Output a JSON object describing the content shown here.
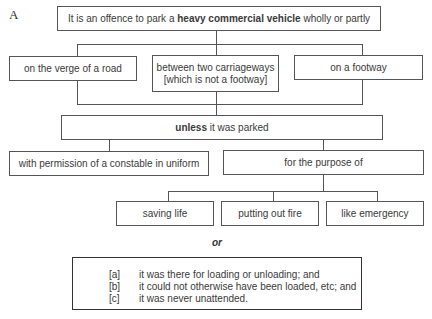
{
  "figure_label": "A",
  "top": {
    "prefix": "It is an offence to park a ",
    "bold": "heavy commercial vehicle",
    "suffix": " wholly or partly"
  },
  "locations": [
    {
      "line1": "on the verge of a road",
      "line2": ""
    },
    {
      "line1": "between two carriageways",
      "line2": "[which is not a footway]"
    },
    {
      "line1": "on a footway",
      "line2": ""
    }
  ],
  "unless": {
    "bold": "unless",
    "suffix": " it was parked"
  },
  "exceptions": [
    {
      "label": "with permission of a constable in uniform"
    },
    {
      "label": "for the purpose of"
    }
  ],
  "purposes": [
    {
      "label": "saving life"
    },
    {
      "label": "putting out fire"
    },
    {
      "label": "like emergency"
    }
  ],
  "or_text": "or",
  "conditions": [
    {
      "marker": "[a]",
      "text": "it was there for loading or unloading; and"
    },
    {
      "marker": "[b]",
      "text": "it could not otherwise have been loaded, etc; and"
    },
    {
      "marker": "[c]",
      "text": "it was never unattended."
    }
  ]
}
